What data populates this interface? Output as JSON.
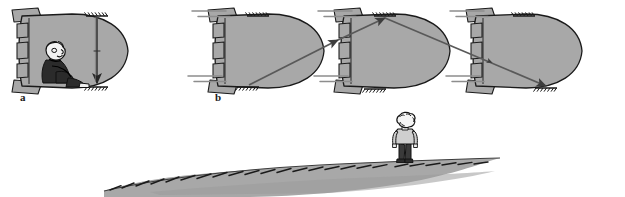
{
  "figure": {
    "background_color": "#ffffff",
    "ink_color": "#1a1a1a",
    "hull_fill": "#a8a8a8",
    "hull_stroke": "#1a1a1a",
    "ray_color": "#4d4d4d",
    "ground_fill": "#a8a8a8",
    "hatch_color": "#1a1a1a"
  },
  "panels": [
    {
      "id": "a",
      "label": "a",
      "label_x": 20,
      "label_y": 101,
      "caption_semantic": "inside-view-light-travels-straight-down",
      "ship": {
        "name": "spaceship-interior-view",
        "nose_direction": "right",
        "fill": "#a8a8a8"
      },
      "observer": {
        "name": "seated-astronaut",
        "pose": "seated-knees-up",
        "head_fill": "#f2f2f2",
        "body_fill": "#2b2b2b"
      },
      "light_path": {
        "name": "vertical-light-ray",
        "shape": "straight-vertical",
        "direction": "downward",
        "arrowheads": 1,
        "from": "ceiling-mirror",
        "to": "floor-mirror"
      },
      "mirrors": [
        "ceiling-mirror",
        "floor-mirror"
      ]
    },
    {
      "id": "b",
      "label": "b",
      "label_x": 215,
      "label_y": 101,
      "caption_semantic": "outside-view-light-travels-diagonal-zigzag",
      "ships": [
        {
          "name": "spaceship-position-1",
          "order": 1,
          "motion_lines": true
        },
        {
          "name": "spaceship-position-2",
          "order": 2,
          "motion_lines": true
        },
        {
          "name": "spaceship-position-3",
          "order": 3,
          "motion_lines": true
        }
      ],
      "light_path": {
        "name": "diagonal-light-ray",
        "shape": "zigzag-v",
        "segments": 2,
        "arrowheads": 3,
        "from": "floor-mirror-position-1",
        "via": "ceiling-mirror-position-2",
        "to": "floor-mirror-position-3"
      }
    },
    {
      "id": "ground",
      "label": "",
      "caption_semantic": "stationary-observer-standing-on-hill",
      "observer": {
        "name": "standing-observer",
        "pose": "standing-back-view",
        "head_fill": "#f2f2f2",
        "shirt_fill": "#cfcfcf",
        "trousers_fill": "#3a3a3a"
      },
      "terrain": {
        "name": "hill-ground",
        "fill": "#a8a8a8",
        "hatch_strokes": 26
      }
    }
  ]
}
